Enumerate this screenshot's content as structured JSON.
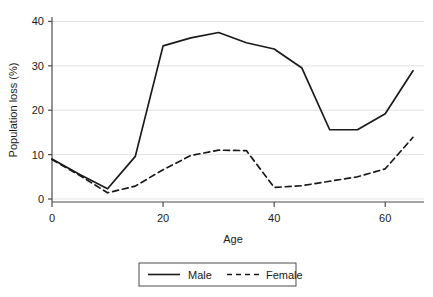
{
  "chart_data": {
    "type": "line",
    "title": "",
    "subtitle": "",
    "xlabel": "Age",
    "ylabel": "Population loss (%)",
    "xlim": [
      0,
      65
    ],
    "ylim": [
      0,
      41
    ],
    "xticks": [
      0,
      20,
      40,
      60
    ],
    "xtick_labels": [
      "0",
      "20",
      "40",
      "60"
    ],
    "yticks": [
      0,
      10,
      20,
      30,
      40
    ],
    "ytick_labels": [
      "0",
      "10",
      "20",
      "30",
      "40"
    ],
    "grid": "horizontal",
    "legend_position": "bottom",
    "x": [
      0,
      5,
      10,
      15,
      20,
      25,
      30,
      35,
      40,
      45,
      50,
      55,
      60,
      65
    ],
    "series": [
      {
        "name": "Male",
        "style": "solid",
        "color": "#1a1a1a",
        "values": [
          9.0,
          5.5,
          2.3,
          9.6,
          34.5,
          36.3,
          37.5,
          35.2,
          33.8,
          29.5,
          15.6,
          15.6,
          19.2,
          28.9
        ]
      },
      {
        "name": "Female",
        "style": "dashed",
        "color": "#1a1a1a",
        "values": [
          8.9,
          5.3,
          1.4,
          2.9,
          6.6,
          9.8,
          11.0,
          10.9,
          2.6,
          3.0,
          4.0,
          5.0,
          6.8,
          13.9
        ]
      }
    ]
  },
  "legend": {
    "entries": [
      {
        "label": "Male",
        "style": "solid"
      },
      {
        "label": "Female",
        "style": "dashed"
      }
    ]
  },
  "axes": {
    "x_title": "Age",
    "y_title": "Population loss (%)"
  }
}
